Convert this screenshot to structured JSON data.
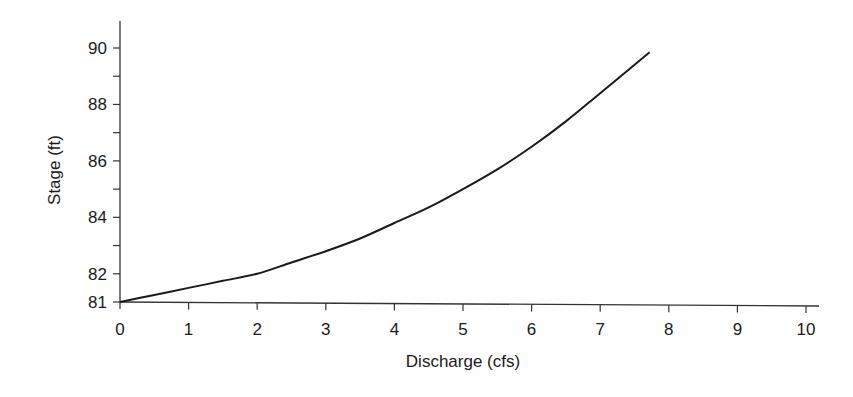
{
  "chart_data": {
    "type": "line",
    "title": "",
    "xlabel": "Discharge (cfs)",
    "ylabel": "Stage (ft)",
    "xlim": [
      0,
      10
    ],
    "ylim": [
      81,
      91
    ],
    "grid": false,
    "legend": null,
    "x_ticks": [
      0,
      1,
      2,
      3,
      4,
      5,
      6,
      7,
      8,
      9,
      10
    ],
    "x_tick_labels": [
      "0",
      "1",
      "2",
      "3",
      "4",
      "5",
      "6",
      "7",
      "8",
      "9",
      "10"
    ],
    "y_major_ticks": [
      81,
      82,
      84,
      86,
      88,
      90
    ],
    "y_tick_labels": [
      "81",
      "82",
      "84",
      "86",
      "88",
      "90"
    ],
    "y_minor_ticks": [
      83,
      85,
      87,
      89
    ],
    "series": [
      {
        "name": "Stage-discharge rating curve",
        "color": "#1a1a1a",
        "x": [
          0,
          0.5,
          1,
          1.5,
          2,
          2.5,
          3,
          3.5,
          4,
          4.5,
          5,
          5.5,
          6,
          6.5,
          7,
          7.72
        ],
        "y": [
          81.0,
          81.25,
          81.5,
          81.75,
          82.0,
          82.4,
          82.8,
          83.25,
          83.8,
          84.35,
          85.0,
          85.7,
          86.5,
          87.4,
          88.4,
          89.85
        ]
      }
    ]
  },
  "colors": {
    "axis": "#333333",
    "line": "#1a1a1a",
    "background": "#ffffff"
  }
}
